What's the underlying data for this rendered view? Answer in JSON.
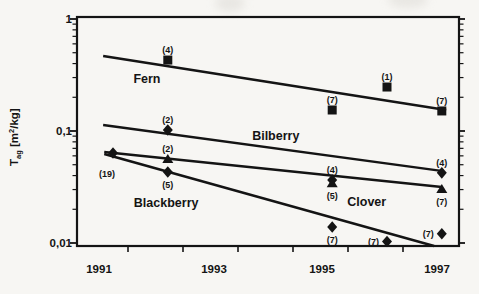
{
  "figure": {
    "ink_color": "#141414",
    "paper_color": "#f7f6f3"
  },
  "axes": {
    "y_title": {
      "base": "T",
      "sub": "ag",
      "mid": " [m",
      "sup": "2",
      "end": "/kg]"
    }
  },
  "chart_data": {
    "type": "scatter",
    "title": "",
    "xlabel": "",
    "ylabel": "T_ag [m^2/kg]",
    "y_scale": "log",
    "ylim": [
      0.009,
      1.05
    ],
    "xlim": [
      1990.3,
      1997.35
    ],
    "x_tick_labels": [
      "1991",
      "1993",
      "1995",
      "1997"
    ],
    "y_tick_labels": [
      "1",
      "0,1",
      "0,01"
    ],
    "legend": "labels placed beside trend lines; counts of samples shown in parentheses at each point",
    "series": [
      {
        "name": "Fern",
        "marker": "square",
        "points": [
          {
            "year": 1992,
            "value": 0.43,
            "n": 4,
            "n_label": "(4)",
            "label_pos": "above"
          },
          {
            "year": 1995,
            "value": 0.154,
            "n": 7,
            "n_label": "(7)",
            "label_pos": "above"
          },
          {
            "year": 1996,
            "value": 0.247,
            "n": 1,
            "n_label": "(1)",
            "label_pos": "above"
          },
          {
            "year": 1997,
            "value": 0.151,
            "n": 7,
            "n_label": "(7)",
            "label_pos": "above"
          }
        ],
        "trend_line": {
          "year": [
            1990.82,
            1997.08
          ],
          "value": [
            0.467,
            0.154
          ]
        },
        "name_anchor": {
          "year": 1991.62,
          "value": 0.297
        }
      },
      {
        "name": "Bilberry",
        "marker": "diamond",
        "points": [
          {
            "year": 1992,
            "value": 0.102,
            "n": 2,
            "n_label": "(2)",
            "label_pos": "above"
          },
          {
            "year": 1995,
            "value": 0.0365,
            "n": 4,
            "n_label": "(4)",
            "label_pos": "above"
          },
          {
            "year": 1997,
            "value": 0.0423,
            "n": 4,
            "n_label": "(4)",
            "label_pos": "above"
          }
        ],
        "trend_line": {
          "year": [
            1990.82,
            1996.99
          ],
          "value": [
            0.113,
            0.044
          ]
        },
        "name_anchor": {
          "year": 1993.97,
          "value": 0.0903
        }
      },
      {
        "name": "Clover",
        "marker": "triangle",
        "points": [
          {
            "year": 1992,
            "value": 0.0562,
            "n": 2,
            "n_label": "(2)",
            "label_pos": "above"
          },
          {
            "year": 1995,
            "value": 0.0342,
            "n": 5,
            "n_label": "(5)",
            "label_pos": "below"
          },
          {
            "year": 1997,
            "value": 0.0303,
            "n": 7,
            "n_label": "(7)",
            "label_pos": "below"
          }
        ],
        "trend_line": {
          "year": [
            1990.84,
            1997.0
          ],
          "value": [
            0.0649,
            0.0316
          ]
        },
        "name_anchor": {
          "year": 1995.63,
          "value": 0.0237
        }
      },
      {
        "name": "Blackberry",
        "marker": "diamond",
        "points": [
          {
            "year": 1991,
            "value": 0.0637,
            "n": 19,
            "n_label": "(19)",
            "label_pos": "below-far"
          },
          {
            "year": 1992,
            "value": 0.043,
            "n": 5,
            "n_label": "(5)",
            "label_pos": "below"
          },
          {
            "year": 1995,
            "value": 0.0139,
            "n": 7,
            "n_label": "(7)",
            "label_pos": "below"
          },
          {
            "year": 1996,
            "value": 0.0103,
            "n": 7,
            "n_label": "(7)",
            "label_pos": "left"
          },
          {
            "year": 1997,
            "value": 0.0121,
            "n": 7,
            "n_label": "(7)",
            "label_pos": "left"
          }
        ],
        "trend_line": {
          "year": [
            1990.84,
            1996.86
          ],
          "value": [
            0.0623,
            0.0094
          ]
        },
        "name_anchor": {
          "year": 1991.97,
          "value": 0.0228
        }
      }
    ]
  }
}
